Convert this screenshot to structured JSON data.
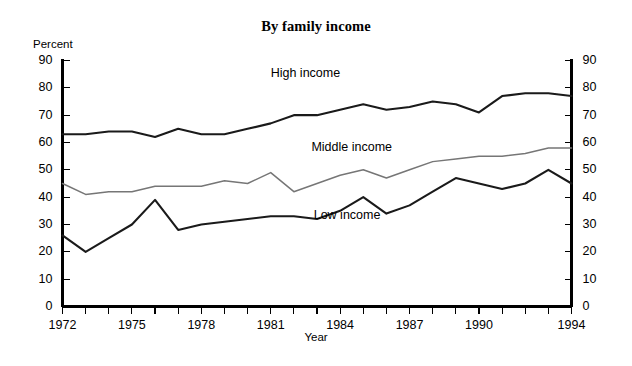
{
  "chart_data": {
    "type": "line",
    "title": "By family income",
    "xlabel": "Year",
    "ylabel": "Percent",
    "xlim": [
      1972,
      1994
    ],
    "ylim": [
      0,
      90
    ],
    "grid": false,
    "legend_position": "inline-annotations",
    "y_ticks": [
      0,
      10,
      20,
      30,
      40,
      50,
      60,
      70,
      80,
      90
    ],
    "y_ticks_right": [
      0,
      10,
      20,
      30,
      40,
      50,
      60,
      70,
      80,
      90
    ],
    "x_ticks": [
      1972,
      1975,
      1978,
      1981,
      1984,
      1987,
      1990,
      1994
    ],
    "x_all_ticks": [
      1972,
      1973,
      1974,
      1975,
      1976,
      1977,
      1978,
      1979,
      1980,
      1981,
      1982,
      1983,
      1984,
      1985,
      1986,
      1987,
      1988,
      1989,
      1990,
      1991,
      1992,
      1993,
      1994
    ],
    "x": [
      1972,
      1973,
      1974,
      1975,
      1976,
      1977,
      1978,
      1979,
      1980,
      1981,
      1982,
      1983,
      1984,
      1985,
      1986,
      1987,
      1988,
      1989,
      1990,
      1991,
      1992,
      1993,
      1994
    ],
    "series": [
      {
        "name": "High income",
        "color": "#1a1a1a",
        "label_x": 1982.5,
        "label_y": 85,
        "values": [
          63,
          63,
          64,
          64,
          62,
          65,
          63,
          63,
          65,
          67,
          70,
          70,
          72,
          74,
          72,
          73,
          75,
          74,
          71,
          77,
          78,
          78,
          77
        ]
      },
      {
        "name": "Middle income",
        "color": "#767676",
        "label_x": 1984.5,
        "label_y": 58,
        "values": [
          45,
          41,
          42,
          42,
          44,
          44,
          44,
          46,
          45,
          49,
          42,
          45,
          48,
          50,
          47,
          50,
          53,
          54,
          55,
          55,
          56,
          58,
          58
        ]
      },
      {
        "name": "Low income",
        "color": "#1a1a1a",
        "label_x": 1984.3,
        "label_y": 33,
        "values": [
          26,
          20,
          25,
          30,
          39,
          28,
          30,
          31,
          32,
          33,
          33,
          32,
          35,
          40,
          34,
          37,
          42,
          47,
          45,
          43,
          45,
          50,
          45
        ]
      }
    ]
  },
  "labels": {
    "percent": "Percent",
    "year": "Year",
    "title": "By family income",
    "high_income": "High income",
    "middle_income": "Middle income",
    "low_income": "Low income"
  }
}
